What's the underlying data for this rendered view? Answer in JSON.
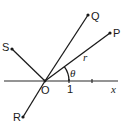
{
  "diagram": {
    "type": "polar-coordinate-rays",
    "origin": {
      "label": "O",
      "x": 45,
      "y": 81
    },
    "axis": {
      "label": "x",
      "x1": 4,
      "x2": 118,
      "y": 81,
      "unit_label": "1",
      "unit_tick_x": 69,
      "second_tick_x": 92
    },
    "angle": {
      "label": "θ",
      "arc_radius": 24
    },
    "radius_label": "r",
    "rays": [
      {
        "id": "P",
        "label": "P",
        "x": 110,
        "y": 33,
        "label_x": 113,
        "label_y": 37
      },
      {
        "id": "Q",
        "label": "Q",
        "x": 88,
        "y": 15,
        "label_x": 91,
        "label_y": 20
      },
      {
        "id": "S",
        "label": "S",
        "x": 12,
        "y": 49,
        "label_x": 2,
        "label_y": 51
      },
      {
        "id": "R",
        "label": "R",
        "x": 23,
        "y": 117,
        "label_x": 13,
        "label_y": 121
      }
    ]
  }
}
